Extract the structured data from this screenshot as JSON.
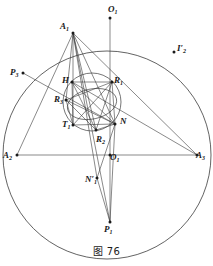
{
  "figure": {
    "caption": "图 76",
    "top_cut_text": "￼ ￼ ￼ ￼ ￼ ￼ ￼",
    "stroke_color": "#3b3b3b",
    "label_color": "#1a1a1a",
    "background": "#ffffff"
  },
  "labels": {
    "A1": {
      "base": "A",
      "sub": "1",
      "prime": "",
      "x": 60,
      "y": 22
    },
    "A2": {
      "base": "A",
      "sub": "2",
      "prime": "",
      "x": 3,
      "y": 151
    },
    "A3": {
      "base": "A",
      "sub": "3",
      "prime": "",
      "x": 196,
      "y": 151
    },
    "O1_top": {
      "base": "O",
      "sub": "1",
      "prime": "",
      "x": 108,
      "y": 5
    },
    "O1_center": {
      "base": "O",
      "sub": "1",
      "prime": "",
      "x": 110,
      "y": 153
    },
    "P1": {
      "base": "P",
      "sub": "1",
      "prime": "",
      "x": 104,
      "y": 225
    },
    "P3": {
      "base": "P",
      "sub": "3",
      "prime": "",
      "x": 10,
      "y": 68
    },
    "I2p": {
      "base": "I",
      "sub": "2",
      "prime": "′",
      "x": 177,
      "y": 44
    },
    "H": {
      "base": "H",
      "sub": "",
      "prime": "",
      "x": 62,
      "y": 76
    },
    "R1": {
      "base": "R",
      "sub": "1",
      "prime": "",
      "x": 114,
      "y": 76
    },
    "R2": {
      "base": "R",
      "sub": "2",
      "prime": "",
      "x": 96,
      "y": 135
    },
    "R3": {
      "base": "R",
      "sub": "3",
      "prime": "",
      "x": 54,
      "y": 95
    },
    "T1": {
      "base": "T",
      "sub": "1",
      "prime": "",
      "x": 62,
      "y": 120
    },
    "N": {
      "base": "N",
      "sub": "",
      "prime": "",
      "x": 120,
      "y": 117
    },
    "N1p": {
      "base": "N",
      "sub": "1",
      "prime": "′",
      "x": 85,
      "y": 175
    }
  },
  "geometry": {
    "outer_circle": {
      "cx": 107,
      "cy": 155,
      "r": 104,
      "note": "large circumscribed circle"
    },
    "inner_circle": {
      "cx": 92,
      "cy": 102,
      "r": 29,
      "note": "nine-point / inner circle"
    },
    "inner_ellipse": {
      "cx": 92,
      "cy": 104,
      "rx": 25,
      "ry": 15,
      "rot": -12
    },
    "points": {
      "A1": [
        73,
        33
      ],
      "A2": [
        17,
        155
      ],
      "A3": [
        197,
        155
      ],
      "O1_top": [
        110,
        18
      ],
      "O1_center": [
        110,
        155
      ],
      "P1": [
        110,
        222
      ],
      "P3": [
        23,
        73
      ],
      "I2p": [
        174,
        52
      ],
      "H": [
        72,
        82
      ],
      "R1": [
        112,
        82
      ],
      "R2": [
        96,
        130
      ],
      "R3": [
        66,
        100
      ],
      "T1": [
        73,
        125
      ],
      "N": [
        115,
        124
      ],
      "N1p": [
        97,
        178
      ]
    },
    "dot_points": [
      "A1",
      "A2",
      "A3",
      "O1_top",
      "O1_center",
      "P1",
      "P3",
      "I2p",
      "H",
      "R1",
      "R2",
      "R3",
      "T1",
      "N",
      "N1p"
    ],
    "segments": [
      [
        "A2",
        "A3"
      ],
      [
        "A1",
        "A2"
      ],
      [
        "A1",
        "A3"
      ],
      [
        "A1",
        "P1"
      ],
      [
        "A1",
        "N1p"
      ],
      [
        "A1",
        "T1"
      ],
      [
        "A1",
        "R3"
      ],
      [
        "A1",
        "N"
      ],
      [
        "A1",
        "R2"
      ],
      [
        "O1_top",
        "P1"
      ],
      [
        "H",
        "R1"
      ],
      [
        "H",
        "N"
      ],
      [
        "H",
        "R2"
      ],
      [
        "H",
        "T1"
      ],
      [
        "R3",
        "R1"
      ],
      [
        "R3",
        "N"
      ],
      [
        "R3",
        "R2"
      ],
      [
        "R3",
        "T1"
      ],
      [
        "T1",
        "N"
      ],
      [
        "T1",
        "R1"
      ],
      [
        "R2",
        "R1"
      ],
      [
        "R2",
        "N"
      ],
      [
        "R1",
        "N"
      ],
      [
        "N",
        "N1p"
      ],
      [
        "N",
        "P1"
      ],
      [
        "P3",
        "N"
      ],
      [
        "A3",
        "H"
      ],
      [
        "N1p",
        "P1"
      ]
    ]
  }
}
